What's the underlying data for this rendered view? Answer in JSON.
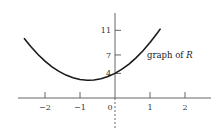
{
  "chart_data": {
    "type": "line",
    "title": "",
    "xlabel": "",
    "ylabel": "",
    "function": "R(x) = 4 + 3x + 2x^2",
    "xlim": [
      -2.6,
      1.3
    ],
    "ylim": [
      0,
      12
    ],
    "x_ticks": [
      -2,
      -1,
      0,
      1,
      2
    ],
    "x_tick_labels": [
      "−2",
      "−1",
      "0",
      "1",
      "2"
    ],
    "y_ticks": [
      4,
      7,
      11
    ],
    "y_tick_labels": [
      "4",
      "7",
      "11"
    ],
    "grid": false,
    "legend": null,
    "annotations": [
      {
        "text_prefix": "graph of ",
        "text_var": "R",
        "near": [
          1.1,
          7.5
        ]
      }
    ],
    "series": [
      {
        "name": "R",
        "x": [
          -2.6,
          -2.4,
          -2.2,
          -2.0,
          -1.8,
          -1.6,
          -1.4,
          -1.2,
          -1.0,
          -0.8,
          -0.75,
          -0.6,
          -0.4,
          -0.2,
          0.0,
          0.2,
          0.4,
          0.6,
          0.8,
          1.0,
          1.2,
          1.3
        ],
        "values": [
          9.72,
          8.32,
          7.08,
          6.0,
          5.08,
          4.32,
          3.72,
          3.28,
          3.0,
          2.88,
          2.875,
          2.92,
          3.12,
          3.48,
          4.0,
          4.68,
          5.52,
          6.52,
          7.68,
          9.0,
          10.48,
          11.28
        ]
      }
    ],
    "special_marks": {
      "dashed_y_axis_below_origin": true
    }
  },
  "colors": {
    "curve": "#1a1a1a",
    "axis": "#555555",
    "text": "#333333"
  }
}
